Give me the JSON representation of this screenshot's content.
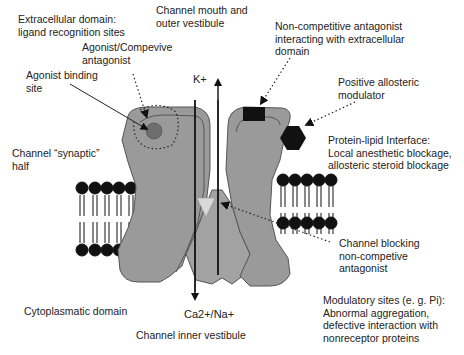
{
  "colors": {
    "protein_fill": "#9a9a9a",
    "protein_stroke": "#555555",
    "agonist_site": "#6e6e6e",
    "ligand_black": "#111111",
    "blocker_fill": "#d8d8d8",
    "lipid": "#111111"
  },
  "ions": {
    "top": "K+",
    "bottom": "Ca2+/Na+"
  },
  "labels": {
    "extracellular": [
      "Extracellular domain:",
      "ligand recognition sites"
    ],
    "channel_mouth": [
      "Channel mouth and",
      "outer vestibule"
    ],
    "agonist_competitive": [
      "Agonist/Compevive",
      "antagonist"
    ],
    "agonist_binding": [
      "Agonist binding",
      "site"
    ],
    "noncompetitive_extracellular": [
      "Non-competitive antagonist",
      "interacting with extracellular",
      "domain"
    ],
    "positive_allosteric": [
      "Positive allosteric",
      "modulator"
    ],
    "synaptic_half": [
      "Channel “synaptic”",
      "half"
    ],
    "protein_lipid": [
      "Protein-lipid Interface:",
      "Local anesthetic blockage,",
      "allosteric steroid blockage"
    ],
    "channel_blocking": [
      "Channel blocking",
      "non-competive",
      "antagonist"
    ],
    "cytoplasmatic": [
      "Cytoplasmatic domain"
    ],
    "inner_vestibule": [
      "Channel inner vestibule"
    ],
    "modulatory": [
      "Modulatory sites (e. g. Pi):",
      "Abnormal aggregation,",
      "defective interaction with",
      "nonreceptor proteins"
    ]
  }
}
